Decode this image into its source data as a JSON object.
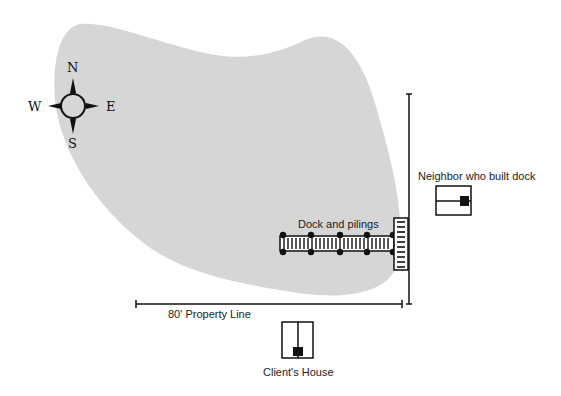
{
  "diagram": {
    "type": "site-plan",
    "colors": {
      "lake_fill": "#d6d6d6",
      "ink": "#111111",
      "background": "#ffffff"
    },
    "compass": {
      "north": "N",
      "south": "S",
      "west": "W",
      "east": "E"
    },
    "labels": {
      "dock": "Dock and pilings",
      "neighbor": "Neighbor who built dock",
      "property_line": "80' Property Line",
      "client_house": "Client's House"
    },
    "dock": {
      "pilings_count": 10,
      "piling_x": [
        283,
        311,
        340,
        367,
        393
      ]
    }
  }
}
